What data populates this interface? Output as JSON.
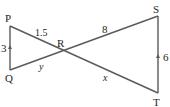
{
  "diagram": {
    "points": {
      "P": "P",
      "Q": "Q",
      "R": "R",
      "S": "S",
      "T": "T"
    },
    "labels": {
      "PQ": "3",
      "PR": "1.5",
      "QR": "y",
      "RS": "8",
      "RT": "x",
      "ST": "6"
    },
    "line_color": "#555555"
  }
}
